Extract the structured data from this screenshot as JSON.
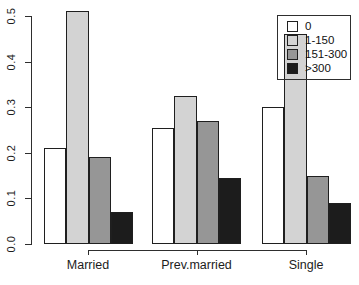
{
  "chart_data": {
    "type": "bar",
    "grouped": true,
    "title": "",
    "xlabel": "",
    "ylabel": "",
    "categories": [
      "Married",
      "Prev.married",
      "Single"
    ],
    "series": [
      {
        "name": "0",
        "color": "#ffffff",
        "values": [
          0.21,
          0.255,
          0.3
        ]
      },
      {
        "name": "1-150",
        "color": "#d3d3d3",
        "values": [
          0.51,
          0.325,
          0.46
        ]
      },
      {
        "name": "151-300",
        "color": "#969696",
        "values": [
          0.19,
          0.27,
          0.15
        ]
      },
      {
        "name": ">300",
        "color": "#1c1c1c",
        "values": [
          0.07,
          0.145,
          0.09
        ]
      }
    ],
    "ylim": [
      0,
      0.5
    ],
    "yticks": [
      0.0,
      0.1,
      0.2,
      0.3,
      0.4,
      0.5
    ],
    "ytick_labels": [
      "0.0",
      "0.1",
      "0.2",
      "0.3",
      "0.4",
      "0.5"
    ],
    "grid": false,
    "legend": {
      "position": "top-right",
      "entries": [
        "0",
        "1-150",
        "151-300",
        ">300"
      ],
      "transparent_background": true
    },
    "colors": {
      "background": "#ffffff",
      "axis": "#2e2e2e",
      "bar_border": "#1f1f1f",
      "text": "#1c1c1c"
    }
  }
}
